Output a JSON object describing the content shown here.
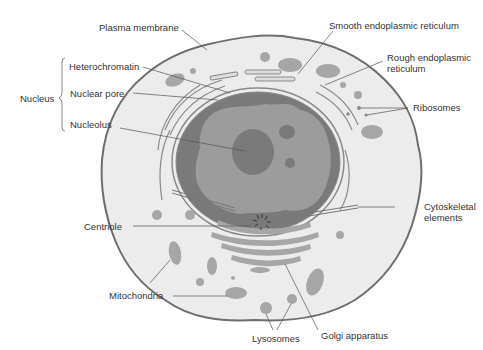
{
  "labels": {
    "plasma_membrane": "Plasma membrane",
    "nucleus_group": "Nucleus",
    "heterochromatin": "Heterochromatin",
    "nuclear_pore": "Nuclear pore",
    "nucleolus": "Nucleolus",
    "centriole": "Centriole",
    "mitochondria": "Mitochondria",
    "smooth_er": "Smooth endoplasmic reticulum",
    "rough_er_line1": "Rough endoplasmic",
    "rough_er_line2": "reticulum",
    "ribosomes": "Ribosomes",
    "cytoskeletal_line1": "Cytoskeletal",
    "cytoskeletal_line2": "elements",
    "lysosomes": "Lysosomes",
    "golgi": "Golgi apparatus"
  },
  "colors": {
    "cytoplasm": "#ececec",
    "membrane": "#6e6e6e",
    "nucleus_dark": "#7a7a7a",
    "nucleoplasm": "#9c9c9c",
    "organelle": "#a6a6a6",
    "leader_line": "#555555",
    "text": "#333333"
  }
}
